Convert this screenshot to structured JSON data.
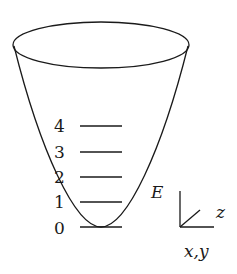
{
  "diagram": {
    "type": "quantum harmonic oscillator potential well",
    "stroke_color": "#1a1a1a",
    "background": "#ffffff",
    "energy_levels": [
      {
        "label": "4",
        "y": 126
      },
      {
        "label": "3",
        "y": 152
      },
      {
        "label": "2",
        "y": 177
      },
      {
        "label": "1",
        "y": 202
      },
      {
        "label": "0",
        "y": 227
      }
    ],
    "energy_axis_label": "E",
    "axes": {
      "z_label": "z",
      "xy_label": "x,y"
    }
  }
}
